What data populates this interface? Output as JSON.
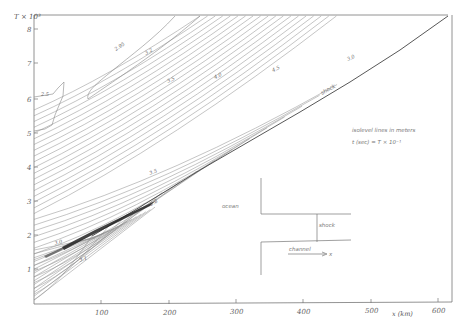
{
  "chart_data": {
    "type": "contour",
    "title": "",
    "xlabel": "x (km)",
    "ylabel": "T × 10³",
    "xlim": [
      0,
      620
    ],
    "ylim": [
      0,
      8.5
    ],
    "x_ticks": [
      "100",
      "200",
      "300",
      "400",
      "500",
      "600"
    ],
    "y_ticks": [
      "1",
      "2",
      "3",
      "4",
      "5",
      "6",
      "7",
      "8"
    ],
    "grid": false,
    "legend": null,
    "annotations": {
      "note_line1": "isolevel lines in meters",
      "note_line2": "t (sec) = T × 10⁻¹",
      "shock_label": "shock",
      "contour_labels": [
        "2.95",
        "3.2",
        "3.5",
        "4.0",
        "4.5",
        "3.0",
        "3.5",
        "3.95",
        "3.0",
        "3.1",
        "2.5",
        "2.8"
      ]
    },
    "inset": {
      "ocean_label": "ocean",
      "shock_label": "shock",
      "channel_label": "channel",
      "x_arrow_label": "x"
    },
    "shock_line": {
      "x": [
        90,
        620
      ],
      "y": [
        2.0,
        8.4
      ]
    },
    "colors": {
      "ink": "#555555",
      "background": "#ffffff"
    }
  }
}
